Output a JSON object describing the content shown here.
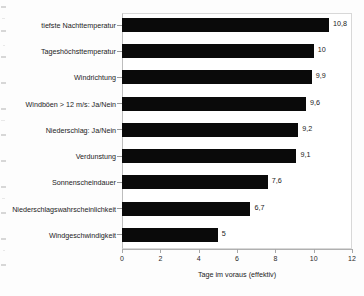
{
  "chart_data": {
    "type": "bar",
    "orientation": "horizontal",
    "title": "",
    "subtitle": "",
    "categories": [
      "tiefste Nachttemperatur",
      "Tageshöchsttemperatur",
      "Windrichtung",
      "Windböen > 12 m/s: Ja/Nein",
      "Niederschlag: Ja/Nein",
      "Verdunstung",
      "Sonnenscheindauer",
      "Niederschlagswahrscheinlichkeit",
      "Windgeschwindigkeit"
    ],
    "values": [
      10.8,
      10,
      9.9,
      9.6,
      9.2,
      9.1,
      7.6,
      6.7,
      5
    ],
    "value_labels": [
      "10,8",
      "10",
      "9,9",
      "9,6",
      "9,2",
      "9,1",
      "7,6",
      "6,7",
      "5"
    ],
    "xlabel": "Tage im voraus (effektiv)",
    "ylabel": "",
    "xlim": [
      0,
      12
    ],
    "xticks": [
      0,
      2,
      4,
      6,
      8,
      10,
      12
    ],
    "xtick_labels": [
      "0",
      "2",
      "4",
      "6",
      "8",
      "10",
      "12"
    ],
    "grid": false,
    "legend": null,
    "bar_color": "#0a0a0a",
    "frame_color": "#d8d8d8",
    "background_color": "#ffffff"
  }
}
